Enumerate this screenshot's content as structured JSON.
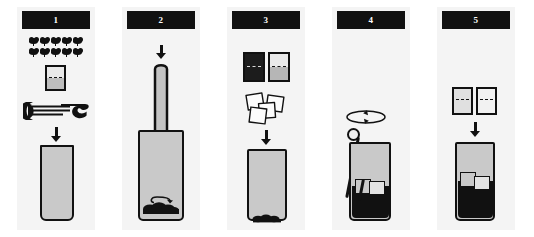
{
  "figure": {
    "kind": "step-by-step-recipe-infographic",
    "panel_count": 5,
    "background_color": "#ffffff",
    "panel_background_color": "#f4f4f4",
    "header_background_color": "#111111",
    "header_text_color": "#ffffff",
    "ink_color": "#111111",
    "glass_fill_color": "#c9c9c9",
    "liquid_color": "#111111"
  },
  "panels": [
    {
      "number": "1",
      "name": "add-mint-lime-and-sugar",
      "icons": [
        "mint-leaf-icon",
        "sugar-measure-icon",
        "lime-squeezer-icon",
        "arrow-down-icon",
        "empty-tall-glass-icon"
      ],
      "mint_leaf_count": 10,
      "mint_leaf_rows": 2,
      "mint_leaves_per_row": 5,
      "measure_fill": "half",
      "glass_state": "empty"
    },
    {
      "number": "2",
      "name": "muddle-ingredients",
      "icons": [
        "arrow-down-icon",
        "muddler-icon",
        "rotation-arrow-icon",
        "crushed-mint-icon",
        "tall-glass-icon"
      ],
      "glass_state": "muddled-mint-at-bottom"
    },
    {
      "number": "3",
      "name": "add-spirit-and-ice",
      "icons": [
        "dark-measure-icon",
        "light-measure-icon",
        "ice-cubes-icon",
        "arrow-down-icon",
        "tall-glass-icon"
      ],
      "measure_count": 2,
      "measure_left_fill": "full-dark",
      "measure_right_fill": "half",
      "ice_cube_count": 4,
      "glass_state": "muddled-mint-at-bottom"
    },
    {
      "number": "4",
      "name": "stir-the-drink",
      "icons": [
        "rotation-arrow-icon",
        "bar-spoon-icon",
        "ice-cube-icon",
        "filled-glass-icon"
      ],
      "ice_cube_count": 2,
      "glass_state": "filled-dark-with-ice"
    },
    {
      "number": "5",
      "name": "top-up-and-serve",
      "icons": [
        "light-measure-icon",
        "light-measure-icon",
        "arrow-down-icon",
        "ice-cube-icon",
        "finished-drink-icon"
      ],
      "measure_count": 2,
      "measure_fill": "half",
      "ice_cube_count": 2,
      "glass_state": "finished-drink"
    }
  ]
}
